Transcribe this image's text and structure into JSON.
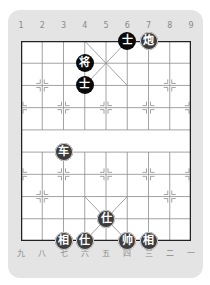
{
  "board": {
    "columns_top": [
      "1",
      "2",
      "3",
      "4",
      "5",
      "6",
      "7",
      "8",
      "9"
    ],
    "columns_bottom": [
      "九",
      "八",
      "七",
      "六",
      "五",
      "四",
      "三",
      "二",
      "一"
    ],
    "colors": {
      "card_bg": "#e4e4e4",
      "board_bg": "#ffffff",
      "grid": "#8c8c8c",
      "border": "#222222",
      "black_piece": "#0a0a0a",
      "red_piece": "#3c3c3c"
    }
  },
  "pieces": [
    {
      "side": "black",
      "char": "士",
      "col": 5,
      "row": 0
    },
    {
      "side": "red",
      "char": "炮",
      "col": 6,
      "row": 0
    },
    {
      "side": "black",
      "char": "将",
      "col": 3,
      "row": 1
    },
    {
      "side": "black",
      "char": "士",
      "col": 3,
      "row": 2
    },
    {
      "side": "red",
      "char": "车",
      "col": 2,
      "row": 5
    },
    {
      "side": "red",
      "char": "仕",
      "col": 4,
      "row": 8
    },
    {
      "side": "red",
      "char": "相",
      "col": 2,
      "row": 9
    },
    {
      "side": "red",
      "char": "仕",
      "col": 3,
      "row": 9
    },
    {
      "side": "red",
      "char": "帅",
      "col": 5,
      "row": 9
    },
    {
      "side": "red",
      "char": "相",
      "col": 6,
      "row": 9
    }
  ]
}
